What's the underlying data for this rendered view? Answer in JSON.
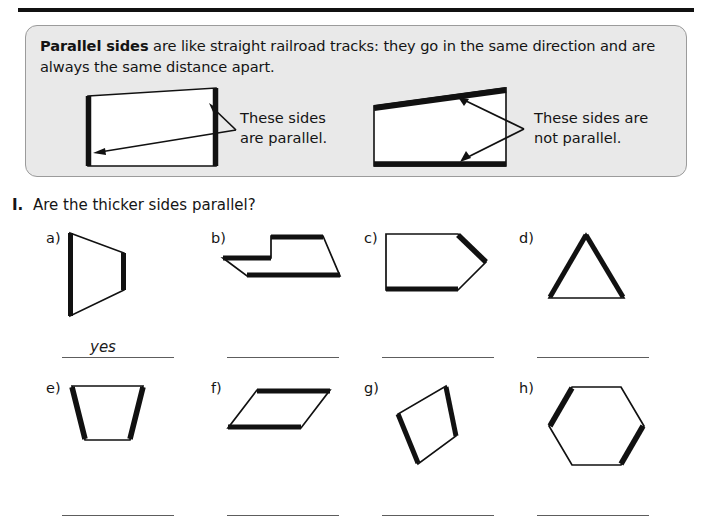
{
  "page": {
    "top_rule": "horizontal-rule",
    "background_color": "#ffffff",
    "ink_color": "#111111"
  },
  "info_box": {
    "background_color": "#e9e9e9",
    "border_color": "#9b9b9b",
    "term": "Parallel sides",
    "body": " are like straight railroad tracks: they go in the same direction and are always the same distance apart.",
    "diagrams": [
      {
        "id": "parallel-example",
        "caption_line1": "These sides",
        "caption_line2": "are parallel.",
        "shape": "quadrilateral",
        "thick_sides": "left and right vertical sides",
        "arrow_count": 2
      },
      {
        "id": "not-parallel-example",
        "caption_line1": "These sides are",
        "caption_line2": "not parallel.",
        "shape": "quadrilateral",
        "thick_sides": "slanted top side and horizontal bottom side",
        "arrow_count": 2
      }
    ]
  },
  "exercise": {
    "number": "I.",
    "prompt": "Are the thicker sides parallel?",
    "items": [
      {
        "label": "a)",
        "shape": "trapezoid-pointing-right",
        "thick_sides": "left vertical and right vertical",
        "answer": "yes"
      },
      {
        "label": "b)",
        "shape": "notched-hexagon",
        "thick_sides": "two upper horizontals and bottom edge",
        "answer": ""
      },
      {
        "label": "c)",
        "shape": "pentagon-arrow",
        "thick_sides": "upper-right diagonal and bottom horizontal",
        "answer": ""
      },
      {
        "label": "d)",
        "shape": "triangle",
        "thick_sides": "left slant and right slant",
        "answer": ""
      },
      {
        "label": "e)",
        "shape": "trapezoid",
        "thick_sides": "left slant and right slant",
        "answer": ""
      },
      {
        "label": "f)",
        "shape": "parallelogram-flat",
        "thick_sides": "top horizontal and bottom horizontal",
        "answer": ""
      },
      {
        "label": "g)",
        "shape": "parallelogram-slanted",
        "thick_sides": "left slant and right slant",
        "answer": ""
      },
      {
        "label": "h)",
        "shape": "hexagon",
        "thick_sides": "upper-left diagonal and lower-right diagonal",
        "answer": ""
      }
    ]
  }
}
